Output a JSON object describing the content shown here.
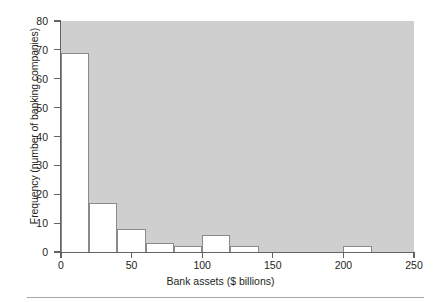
{
  "figure": {
    "background_color": "#ffffff",
    "plot_background_color": "#cfcfcf",
    "bar_fill_color": "#ffffff",
    "bar_edge_color": "#8a8a8a",
    "axis_color": "#636363",
    "text_color": "#231f20"
  },
  "chart_data": {
    "type": "bar",
    "title": "",
    "xlabel": "Bank assets ($ billions)",
    "ylabel": "Frequency (number of banking companies)",
    "xlim": [
      0,
      250
    ],
    "ylim": [
      0,
      80
    ],
    "bin_width": 20,
    "grid": false,
    "legend": null,
    "xticks": [
      0,
      50,
      100,
      150,
      200,
      250
    ],
    "xtick_labels": [
      "0",
      "50",
      "100",
      "150",
      "200",
      "250"
    ],
    "yticks": [
      0,
      10,
      20,
      30,
      40,
      50,
      60,
      70,
      80
    ],
    "ytick_labels": [
      "0",
      "10",
      "20",
      "30",
      "40",
      "50",
      "60",
      "70",
      "80"
    ],
    "bin_edges": [
      0,
      20,
      40,
      60,
      80,
      100,
      120,
      140,
      160,
      180,
      200,
      220,
      240,
      250
    ],
    "categories": [
      "0-20",
      "20-40",
      "40-60",
      "60-80",
      "80-100",
      "100-120",
      "120-140",
      "140-160",
      "160-180",
      "180-200",
      "200-220",
      "220-240",
      "240-250"
    ],
    "values": [
      69,
      17,
      8,
      3,
      2,
      6,
      2,
      0,
      0,
      0,
      2,
      0,
      0
    ]
  }
}
